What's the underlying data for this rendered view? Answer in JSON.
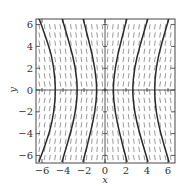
{
  "chart_data": {
    "type": "slope_field",
    "title": "",
    "xlabel": "x",
    "ylabel": "y",
    "xlim": [
      -6.6,
      6.6
    ],
    "ylim": [
      -6.6,
      6.6
    ],
    "x_ticks": [
      -6,
      -4,
      -2,
      0,
      2,
      4,
      6
    ],
    "y_ticks": [
      -6,
      -4,
      -2,
      0,
      2,
      4,
      6
    ],
    "x_tick_labels": [
      "−6",
      "−4",
      "−2",
      "0",
      "2",
      "4",
      "6"
    ],
    "y_tick_labels": [
      "−6",
      "−4",
      "−2",
      "0",
      "2",
      "4",
      "6"
    ],
    "grid": false,
    "slope_sign_rule": "sign(x*y)",
    "solution_curves": [
      {
        "name": "inner-right",
        "points": [
          [
            2.1,
            6.6
          ],
          [
            1.4,
            4
          ],
          [
            0.95,
            2
          ],
          [
            0.75,
            0
          ],
          [
            0.95,
            -2
          ],
          [
            1.4,
            -4
          ],
          [
            2.1,
            -6.6
          ]
        ]
      },
      {
        "name": "middle-right",
        "points": [
          [
            4.1,
            6.6
          ],
          [
            3.3,
            4
          ],
          [
            2.8,
            2
          ],
          [
            2.6,
            0
          ],
          [
            2.8,
            -2
          ],
          [
            3.3,
            -4
          ],
          [
            4.1,
            -6.6
          ]
        ]
      },
      {
        "name": "outer-right",
        "points": [
          [
            6.1,
            6.6
          ],
          [
            5.3,
            4
          ],
          [
            4.85,
            2
          ],
          [
            4.7,
            0
          ],
          [
            4.85,
            -2
          ],
          [
            5.3,
            -4
          ],
          [
            6.1,
            -6.6
          ]
        ]
      },
      {
        "name": "inner-left",
        "points": [
          [
            -2.1,
            6.6
          ],
          [
            -1.4,
            4
          ],
          [
            -0.95,
            2
          ],
          [
            -0.75,
            0
          ],
          [
            -0.95,
            -2
          ],
          [
            -1.4,
            -4
          ],
          [
            -2.1,
            -6.6
          ]
        ]
      },
      {
        "name": "middle-left",
        "points": [
          [
            -4.1,
            6.6
          ],
          [
            -3.3,
            4
          ],
          [
            -2.8,
            2
          ],
          [
            -2.6,
            0
          ],
          [
            -2.8,
            -2
          ],
          [
            -3.3,
            -4
          ],
          [
            -4.1,
            -6.6
          ]
        ]
      },
      {
        "name": "outer-left",
        "points": [
          [
            -6.3,
            6.6
          ],
          [
            -5.3,
            4
          ],
          [
            -4.85,
            2
          ],
          [
            -4.7,
            0
          ],
          [
            -4.85,
            -2
          ],
          [
            -5.3,
            -4
          ],
          [
            -6.3,
            -6.6
          ]
        ]
      }
    ],
    "colors": {
      "curve": "#2a2a2a",
      "field": "#555555",
      "axis": "#333333"
    }
  }
}
